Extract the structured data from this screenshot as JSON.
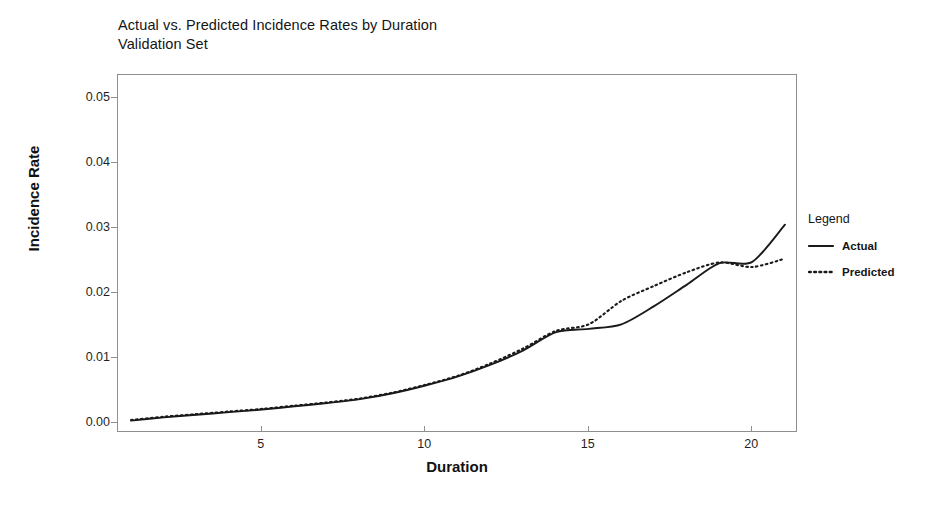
{
  "chart_data": {
    "type": "line",
    "title": "Actual vs. Predicted Incidence Rates by Duration",
    "subtitle": "Validation Set",
    "xlabel": "Duration",
    "ylabel": "Incidence Rate",
    "xlim": [
      0.6,
      21.4
    ],
    "ylim": [
      -0.0015,
      0.0535
    ],
    "grid": false,
    "legend_position": "right",
    "legend_title": "Legend",
    "xticks": [
      5,
      10,
      15,
      20
    ],
    "xtick_labels": [
      "5",
      "10",
      "15",
      "20"
    ],
    "yticks": [
      0.0,
      0.01,
      0.02,
      0.03,
      0.04,
      0.05
    ],
    "ytick_labels": [
      "0.00",
      "0.01",
      "0.02",
      "0.03",
      "0.04",
      "0.05"
    ],
    "x": [
      1,
      2,
      3,
      4,
      5,
      6,
      7,
      8,
      9,
      10,
      11,
      12,
      13,
      14,
      15,
      16,
      17,
      18,
      19,
      20,
      21
    ],
    "series": [
      {
        "name": "Actual",
        "style": "solid",
        "color": "#1a1a1a",
        "values": [
          0.0004,
          0.0009,
          0.0013,
          0.0017,
          0.0021,
          0.0026,
          0.0031,
          0.0037,
          0.0046,
          0.0058,
          0.0072,
          0.009,
          0.0112,
          0.014,
          0.0145,
          0.0152,
          0.018,
          0.0213,
          0.0246,
          0.0248,
          0.0305
        ]
      },
      {
        "name": "Predicted",
        "style": "dotted",
        "color": "#1a1a1a",
        "values": [
          0.0005,
          0.001,
          0.0014,
          0.0018,
          0.0022,
          0.0027,
          0.0032,
          0.0038,
          0.0047,
          0.0059,
          0.0073,
          0.0092,
          0.0115,
          0.0142,
          0.0152,
          0.0188,
          0.0211,
          0.0232,
          0.0247,
          0.024,
          0.0253
        ]
      }
    ]
  },
  "legend": {
    "title": "Legend",
    "items": [
      {
        "label": "Actual",
        "style": "solid"
      },
      {
        "label": "Predicted",
        "style": "dotted"
      }
    ]
  },
  "axes": {
    "x_title": "Duration",
    "y_title": "Incidence Rate"
  }
}
